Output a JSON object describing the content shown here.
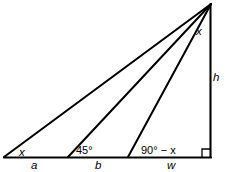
{
  "figure": {
    "stroke_color": "#000000",
    "background_color": "#ffffff"
  },
  "labels": {
    "angle_left": "x",
    "angle_middle": "45°",
    "angle_right": "90° − x",
    "angle_apex": "x",
    "side_height": "h",
    "segment_a": "a",
    "segment_b": "b",
    "segment_w": "w"
  },
  "geometry": {
    "apex": [
      211,
      4
    ],
    "left_vertex": [
      4,
      157
    ],
    "right_vertex": [
      211,
      157
    ],
    "cevian_foot_1": [
      68,
      157
    ],
    "cevian_foot_2": [
      128,
      157
    ],
    "right_angle_marker": [
      211,
      157
    ]
  }
}
